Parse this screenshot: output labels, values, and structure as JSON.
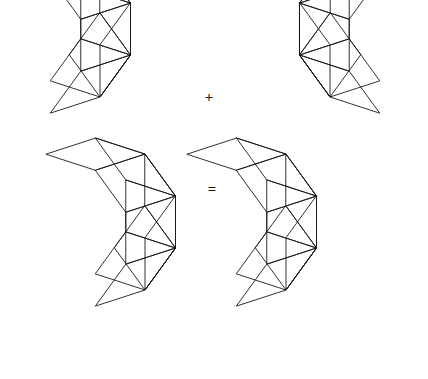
{
  "figure": {
    "background_color": "#ffffff",
    "stroke_color": "#1a1a1a",
    "stroke_width": 0.9,
    "canvas": {
      "width": 428,
      "height": 379
    }
  },
  "operators": [
    {
      "name": "plus",
      "symbol": "+",
      "x": 209,
      "y": 99
    },
    {
      "name": "equals",
      "symbol": "=",
      "x": 212,
      "y": 191
    }
  ],
  "shapes": [
    {
      "name": "addend-left-decagon",
      "label": "left decagon",
      "kind": "rhombic-decagon",
      "mirrored": false,
      "center_x": 100,
      "center_y": 97,
      "radius": 84,
      "rotation_deg": -18
    },
    {
      "name": "addend-right-decagon",
      "label": "right decagon",
      "kind": "rhombic-decagon",
      "mirrored": true,
      "center_x": 330,
      "center_y": 97,
      "radius": 84,
      "rotation_deg": -18
    },
    {
      "name": "sum-left-decagon",
      "label": "sum left half",
      "kind": "rhombic-decagon",
      "mirrored": false,
      "center_x": 145,
      "center_y": 290,
      "radius": 84,
      "rotation_deg": -18
    },
    {
      "name": "sum-right-decagon",
      "label": "sum right half",
      "kind": "rhombic-decagon",
      "mirrored": false,
      "center_x": 286,
      "center_y": 290,
      "radius": 84,
      "rotation_deg": -18
    }
  ],
  "chart_data": {
    "type": "diagram",
    "elements": [
      {
        "role": "addend",
        "shape": "decagon",
        "tiling": "rhombi",
        "rhombus_count": 10
      },
      {
        "role": "operator",
        "symbol": "+"
      },
      {
        "role": "addend",
        "shape": "decagon",
        "tiling": "rhombi",
        "rhombus_count": 10,
        "mirrored": true
      },
      {
        "role": "operator",
        "symbol": "="
      },
      {
        "role": "sum",
        "shape": "double-decagon",
        "tiling": "rhombi",
        "rhombus_count": 21
      }
    ]
  }
}
